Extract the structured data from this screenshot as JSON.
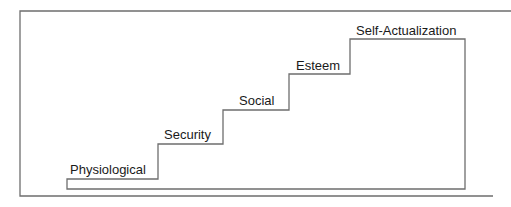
{
  "diagram": {
    "steps": [
      {
        "label": "Physiological"
      },
      {
        "label": "Security"
      },
      {
        "label": "Social"
      },
      {
        "label": "Esteem"
      },
      {
        "label": "Self-Actualization"
      }
    ],
    "colors": {
      "line": "#6e6e6e",
      "text": "#1a1a1a",
      "background": "#ffffff"
    }
  }
}
